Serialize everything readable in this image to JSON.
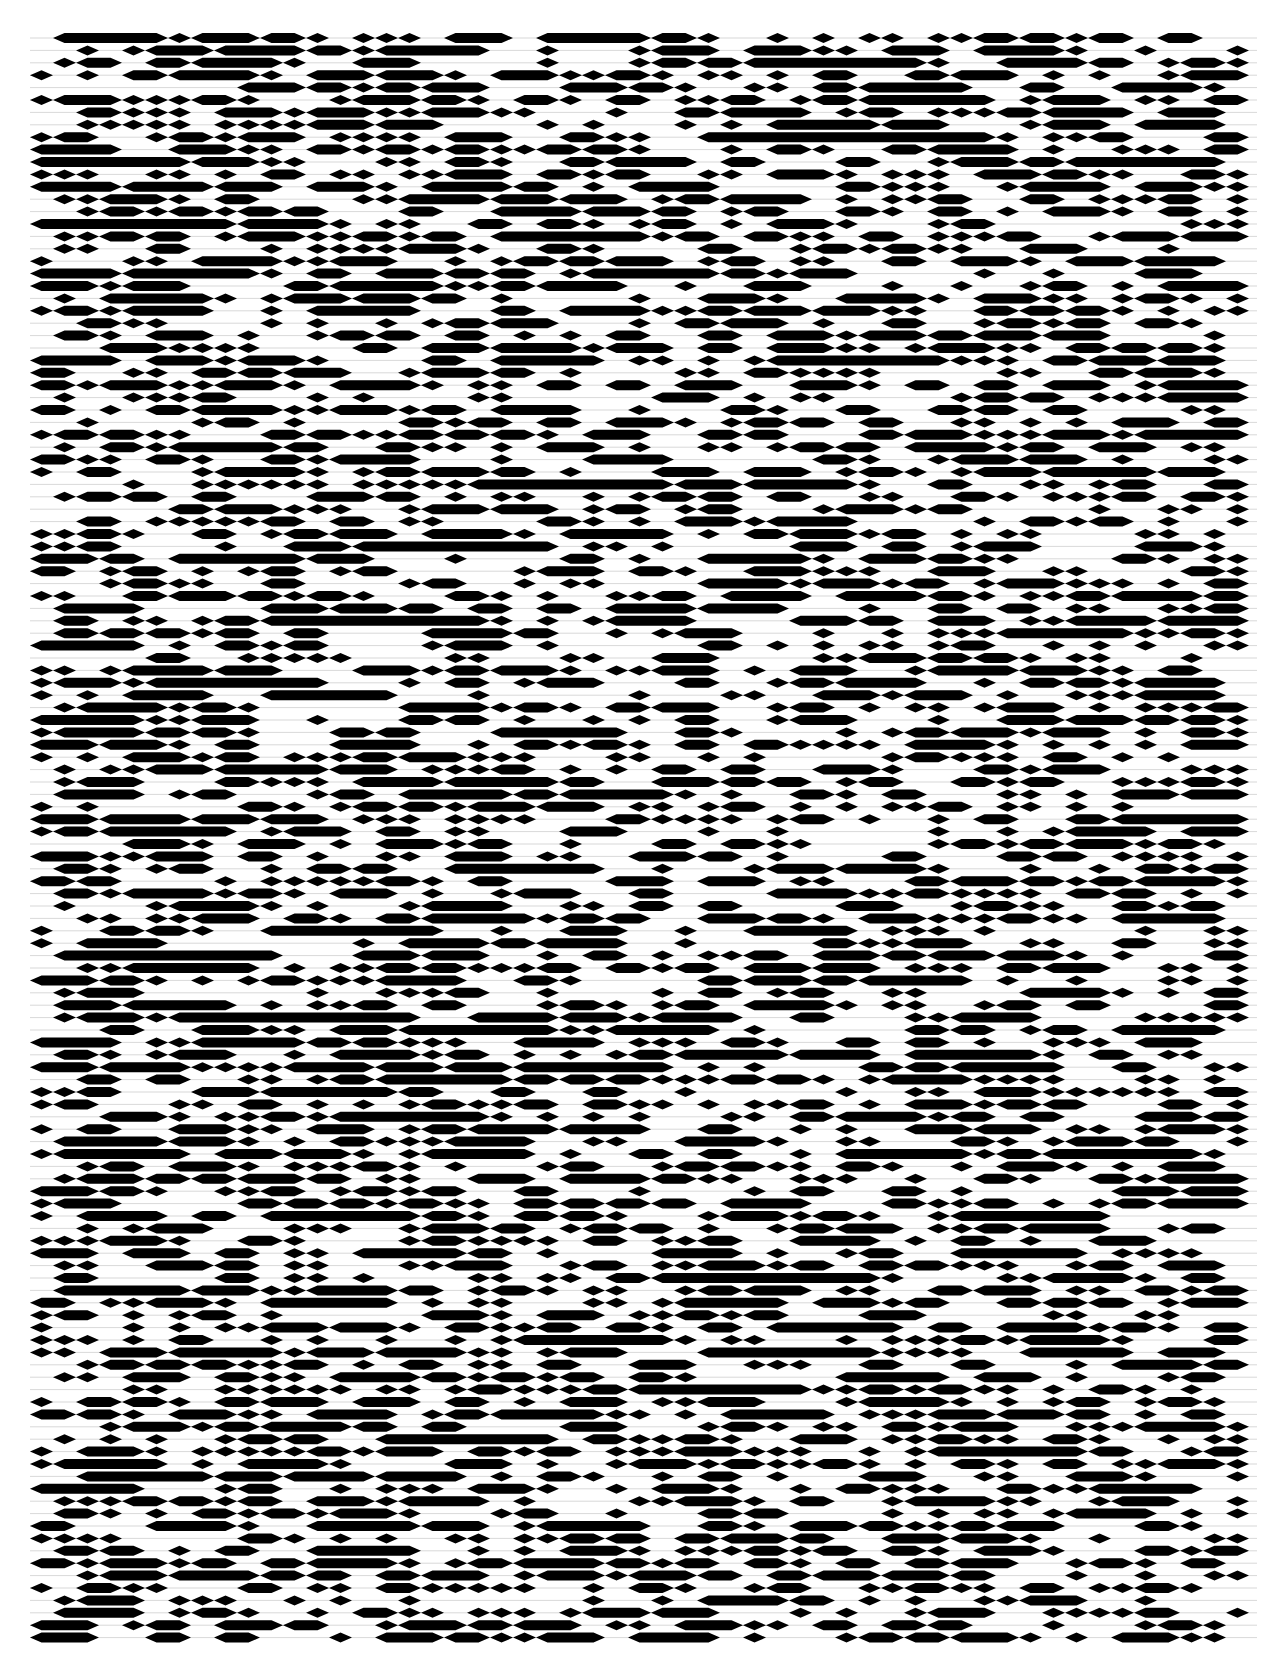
{
  "page": {
    "background": "#ffffff",
    "ink": "#000000",
    "thread": "#bdbdbd"
  },
  "pattern": {
    "description": "dense encoded diamond / hexagonal bar pattern",
    "left": 30,
    "top": 38,
    "right": 1257,
    "rows": 130,
    "row_pitch": 12.4,
    "unit_width": 23,
    "bar_height": 10,
    "seed": 1337,
    "fill_probability": 0.58
  }
}
